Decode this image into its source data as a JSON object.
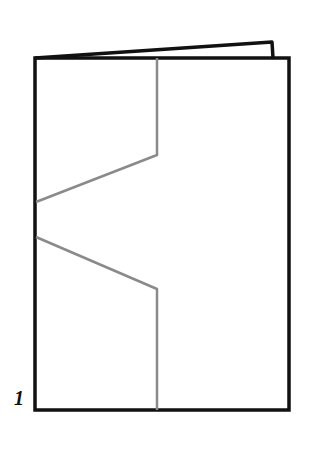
{
  "figure": {
    "label": "1",
    "colors": {
      "outline": "#111111",
      "fold_line": "#8a8a8a",
      "background": "#ffffff"
    }
  }
}
